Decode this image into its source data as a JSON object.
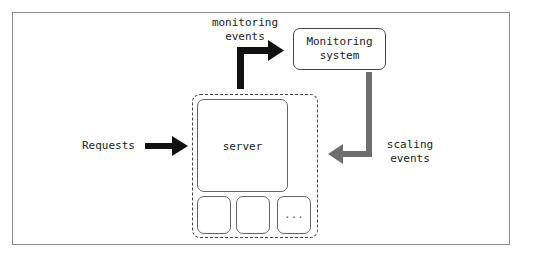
{
  "diagram": {
    "labels": {
      "monitoring_events": "monitoring\nevents",
      "monitoring_system": "Monitoring\nsystem",
      "server": "server",
      "requests": "Requests",
      "scaling_events": "scaling\nevents",
      "ellipsis": "..."
    },
    "colors": {
      "black_arrow": "#111111",
      "gray_arrow": "#6e6e6e",
      "frame": "#8a8a8a"
    },
    "edges": [
      {
        "from": "Requests",
        "to": "server",
        "color": "black"
      },
      {
        "from": "server",
        "to": "Monitoring system",
        "label": "monitoring events",
        "color": "black"
      },
      {
        "from": "Monitoring system",
        "to": "server group",
        "label": "scaling events",
        "color": "gray"
      }
    ]
  }
}
